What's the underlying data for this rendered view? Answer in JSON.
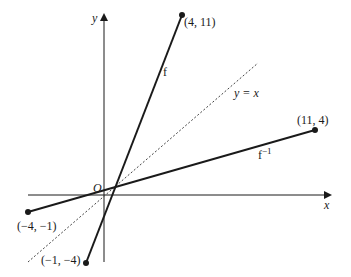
{
  "diagram": {
    "axes": {
      "x_label": "x",
      "y_label": "y",
      "origin_label": "O"
    },
    "curves": {
      "f": {
        "label": "f",
        "start_point": "(−1, −4)",
        "end_point": "(4, 11)"
      },
      "f_inverse": {
        "label": "f",
        "label_superscript": "−1",
        "start_point": "(−4, −1)",
        "end_point": "(11, 4)"
      },
      "mirror_line": {
        "label": "y = x",
        "style": "dashed"
      }
    },
    "colors": {
      "line": "#1a1a1a",
      "dashed": "#444444",
      "background": "#ffffff"
    }
  }
}
